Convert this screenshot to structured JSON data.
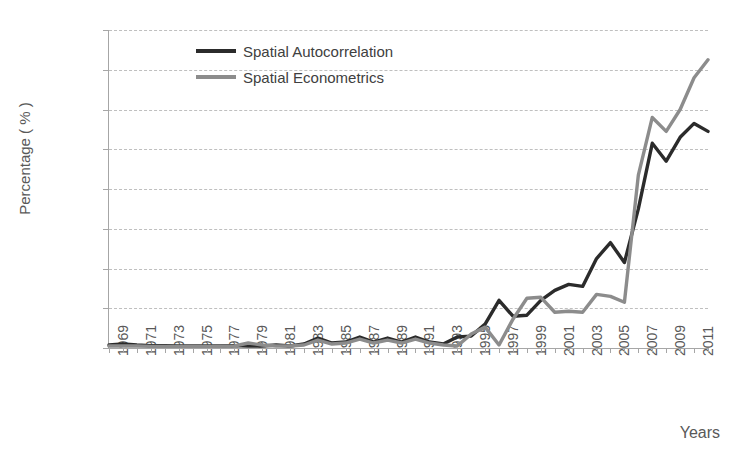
{
  "chart_data": {
    "type": "line",
    "title": "",
    "xlabel": "Years",
    "ylabel": "Percentage ( % )",
    "ylim": [
      0,
      16
    ],
    "yticks": [
      "0%",
      "2%",
      "4%",
      "6%",
      "8%",
      "10%",
      "12%",
      "14%",
      "16%"
    ],
    "ytick_values": [
      0,
      2,
      4,
      6,
      8,
      10,
      12,
      14,
      16
    ],
    "grid": true,
    "legend_position": "top-left",
    "x": [
      1969,
      1970,
      1971,
      1972,
      1973,
      1974,
      1975,
      1976,
      1977,
      1978,
      1979,
      1980,
      1981,
      1982,
      1983,
      1984,
      1985,
      1986,
      1987,
      1988,
      1989,
      1990,
      1991,
      1992,
      1993,
      1994,
      1995,
      1996,
      1997,
      1998,
      1999,
      2000,
      2001,
      2002,
      2003,
      2004,
      2005,
      2006,
      2007,
      2008,
      2009,
      2010,
      2011,
      2012
    ],
    "xtick_labels": [
      "1969",
      "1971",
      "1973",
      "1975",
      "1977",
      "1979",
      "1981",
      "1983",
      "1985",
      "1987",
      "1989",
      "1991",
      "1993",
      "1995",
      "1997",
      "1999",
      "2001",
      "2003",
      "2005",
      "2007",
      "2009",
      "2011"
    ],
    "series": [
      {
        "name": "Spatial Autocorrelation",
        "color": "#2b2b2b",
        "values": [
          0.15,
          0.2,
          0.15,
          0.12,
          0.12,
          0.1,
          0.1,
          0.1,
          0.1,
          0.12,
          0.1,
          0.1,
          0.15,
          0.1,
          0.2,
          0.5,
          0.25,
          0.3,
          0.55,
          0.3,
          0.5,
          0.3,
          0.55,
          0.3,
          0.2,
          0.55,
          0.6,
          1.2,
          2.4,
          1.6,
          1.65,
          2.4,
          2.9,
          3.2,
          3.1,
          4.5,
          5.3,
          4.3,
          7.0,
          10.3,
          9.4,
          10.6,
          11.3,
          10.9
        ]
      },
      {
        "name": "Spatial Econometrics",
        "color": "#8c8c8c",
        "values": [
          0.1,
          0.1,
          0.1,
          0.08,
          0.08,
          0.08,
          0.08,
          0.08,
          0.08,
          0.1,
          0.25,
          0.15,
          0.1,
          0.1,
          0.15,
          0.4,
          0.2,
          0.25,
          0.45,
          0.25,
          0.4,
          0.25,
          0.45,
          0.25,
          0.15,
          0.1,
          0.7,
          1.05,
          0.15,
          1.45,
          2.5,
          2.55,
          1.8,
          1.85,
          1.8,
          2.7,
          2.6,
          2.3,
          8.7,
          11.6,
          10.9,
          12.0,
          13.6,
          14.5
        ]
      }
    ]
  },
  "legend": {
    "items": [
      {
        "label": "Spatial Autocorrelation",
        "color": "#2b2b2b"
      },
      {
        "label": "Spatial Econometrics",
        "color": "#8c8c8c"
      }
    ]
  }
}
